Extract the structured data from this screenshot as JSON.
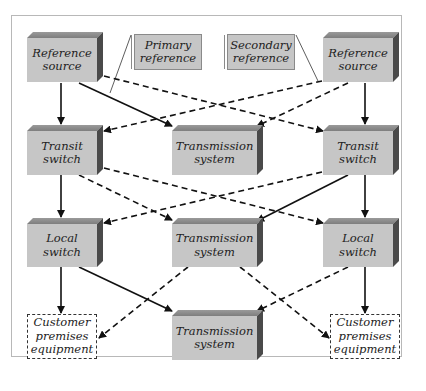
{
  "diagram": {
    "type": "network synchronization hierarchy",
    "colors": {
      "box_front": "#c6c6c6",
      "box_top": "#8e8e8e",
      "box_side": "#4a4a4a",
      "frame_border": "#b8b8b8",
      "line": "#111111"
    },
    "nodes": {
      "ref_left": {
        "label": "Reference source",
        "lines": [
          "Reference",
          "source"
        ]
      },
      "ref_right": {
        "label": "Reference source",
        "lines": [
          "Reference",
          "source"
        ]
      },
      "primary_ref": {
        "label": "Primary reference",
        "lines": [
          "Primary",
          "reference"
        ]
      },
      "secondary_ref": {
        "label": "Secondary reference",
        "lines": [
          "Secondary",
          "reference"
        ]
      },
      "transit_left": {
        "label": "Transit switch",
        "lines": [
          "Transit",
          "switch"
        ]
      },
      "transit_right": {
        "label": "Transit switch",
        "lines": [
          "Transit",
          "switch"
        ]
      },
      "trans_sys_1": {
        "label": "Transmission system",
        "lines": [
          "Transmission",
          "system"
        ]
      },
      "local_left": {
        "label": "Local switch",
        "lines": [
          "Local",
          "switch"
        ]
      },
      "local_right": {
        "label": "Local switch",
        "lines": [
          "Local",
          "switch"
        ]
      },
      "trans_sys_2": {
        "label": "Transmission system",
        "lines": [
          "Transmission",
          "system"
        ]
      },
      "cpe_left": {
        "label": "Customer premises equipment",
        "lines": [
          "Customer",
          "premises",
          "equipment"
        ]
      },
      "cpe_right": {
        "label": "Customer premises equipment",
        "lines": [
          "Customer",
          "premises",
          "equipment"
        ]
      },
      "trans_sys_3": {
        "label": "Transmission system",
        "lines": [
          "Transmission",
          "system"
        ]
      }
    },
    "edges": [
      {
        "from": "ref_left",
        "to": "transit_left",
        "style": "solid"
      },
      {
        "from": "ref_left",
        "to": "trans_sys_1",
        "style": "solid"
      },
      {
        "from": "ref_left",
        "to": "transit_right",
        "style": "dashed"
      },
      {
        "from": "ref_right",
        "to": "transit_right",
        "style": "solid"
      },
      {
        "from": "ref_right",
        "to": "transit_left",
        "style": "dashed"
      },
      {
        "from": "ref_right",
        "to": "trans_sys_1",
        "style": "dashed"
      },
      {
        "from": "transit_left",
        "to": "local_left",
        "style": "solid"
      },
      {
        "from": "transit_left",
        "to": "trans_sys_2",
        "style": "dashed"
      },
      {
        "from": "transit_left",
        "to": "local_right",
        "style": "dashed"
      },
      {
        "from": "transit_right",
        "to": "local_right",
        "style": "solid"
      },
      {
        "from": "transit_right",
        "to": "trans_sys_2",
        "style": "solid"
      },
      {
        "from": "transit_right",
        "to": "local_left",
        "style": "dashed"
      },
      {
        "from": "local_left",
        "to": "cpe_left",
        "style": "solid"
      },
      {
        "from": "local_left",
        "to": "trans_sys_3",
        "style": "solid"
      },
      {
        "from": "local_right",
        "to": "cpe_right",
        "style": "solid"
      },
      {
        "from": "local_right",
        "to": "trans_sys_3",
        "style": "dashed"
      },
      {
        "from": "trans_sys_2",
        "to": "cpe_left",
        "style": "dashed"
      },
      {
        "from": "trans_sys_2",
        "to": "cpe_right",
        "style": "dashed"
      },
      {
        "from": "primary_ref",
        "to": "ref_left",
        "style": "thin-callout"
      },
      {
        "from": "secondary_ref",
        "to": "ref_right",
        "style": "thin-callout"
      }
    ]
  }
}
